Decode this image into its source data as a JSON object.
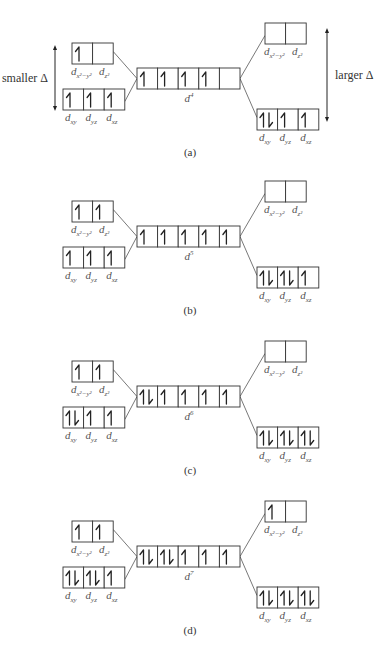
{
  "labels": {
    "smaller": "smaller Δ",
    "larger": "larger Δ",
    "eg_left": [
      "d",
      "x²−y²"
    ],
    "eg_right": [
      "d",
      "z²"
    ],
    "t2g": [
      [
        "d",
        "xy"
      ],
      [
        "d",
        "yz"
      ],
      [
        "d",
        "xz"
      ]
    ]
  },
  "panels": [
    {
      "caption": "(a)",
      "config": "d",
      "electrons": "4",
      "center": [
        "up",
        "up",
        "up",
        "up",
        ""
      ],
      "weak": {
        "eg": [
          "up",
          ""
        ],
        "t2g": [
          "up",
          "up",
          "up"
        ]
      },
      "strong": {
        "eg": [
          "",
          ""
        ],
        "t2g": [
          "pair",
          "up",
          "up"
        ]
      },
      "show_delta_arrows": true
    },
    {
      "caption": "(b)",
      "config": "d",
      "electrons": "5",
      "center": [
        "up",
        "up",
        "up",
        "up",
        "up"
      ],
      "weak": {
        "eg": [
          "up",
          "up"
        ],
        "t2g": [
          "up",
          "up",
          "up"
        ]
      },
      "strong": {
        "eg": [
          "",
          ""
        ],
        "t2g": [
          "pair",
          "pair",
          "up"
        ]
      },
      "show_delta_arrows": false
    },
    {
      "caption": "(c)",
      "config": "d",
      "electrons": "6",
      "center": [
        "pair",
        "up",
        "up",
        "up",
        "up"
      ],
      "weak": {
        "eg": [
          "up",
          "up"
        ],
        "t2g": [
          "pair",
          "up",
          "up"
        ]
      },
      "strong": {
        "eg": [
          "",
          ""
        ],
        "t2g": [
          "pair",
          "pair",
          "pair"
        ]
      },
      "show_delta_arrows": false
    },
    {
      "caption": "(d)",
      "config": "d",
      "electrons": "7",
      "center": [
        "pair",
        "pair",
        "up",
        "up",
        "up"
      ],
      "weak": {
        "eg": [
          "up",
          "up"
        ],
        "t2g": [
          "pair",
          "pair",
          "up"
        ]
      },
      "strong": {
        "eg": [
          "up",
          ""
        ],
        "t2g": [
          "pair",
          "pair",
          "pair"
        ]
      },
      "show_delta_arrows": false
    }
  ]
}
